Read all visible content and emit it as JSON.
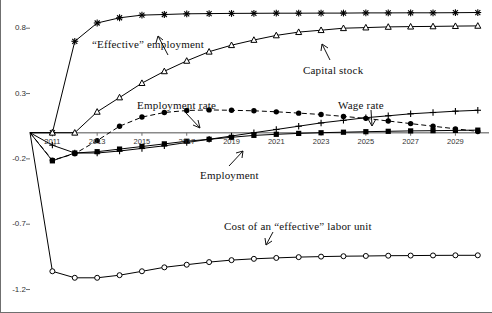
{
  "chart_data": {
    "type": "line",
    "title": "",
    "xlabel": "",
    "ylabel": "",
    "grid": false,
    "legend_position": "inline-annotations",
    "xlim": [
      2010,
      2030.5
    ],
    "ylim": [
      -1.28,
      0.97
    ],
    "yticks": [
      0.8,
      0.3,
      -0.2,
      -0.7,
      -1.2
    ],
    "ytick_labels": [
      "0.8",
      "0.3",
      "-0.2",
      "-0.7",
      "-1.2"
    ],
    "xticks": [
      2011,
      2013,
      2015,
      2017,
      2019,
      2021,
      2023,
      2025,
      2027,
      2029
    ],
    "xtick_labels": [
      "2011",
      "2013",
      "2015",
      "2017",
      "2019",
      "2021",
      "2023",
      "2025",
      "2027",
      "2029"
    ],
    "x": [
      2010,
      2011,
      2012,
      2013,
      2014,
      2015,
      2016,
      2017,
      2018,
      2019,
      2020,
      2021,
      2022,
      2023,
      2024,
      2025,
      2026,
      2027,
      2028,
      2029,
      2030
    ],
    "series": [
      {
        "name": "“Effective” employment",
        "marker": "star",
        "linestyle": "solid",
        "values": [
          0.0,
          0.0,
          0.7,
          0.84,
          0.88,
          0.9,
          0.905,
          0.91,
          0.912,
          0.913,
          0.914,
          0.915,
          0.915,
          0.916,
          0.916,
          0.917,
          0.917,
          0.918,
          0.918,
          0.919,
          0.92
        ]
      },
      {
        "name": "Capital stock",
        "marker": "triangle-open",
        "linestyle": "solid",
        "values": [
          0.0,
          0.0,
          0.0,
          0.16,
          0.27,
          0.38,
          0.47,
          0.55,
          0.62,
          0.67,
          0.71,
          0.745,
          0.77,
          0.785,
          0.8,
          0.805,
          0.81,
          0.812,
          0.814,
          0.816,
          0.818
        ]
      },
      {
        "name": "Employment rate",
        "marker": "circle-filled",
        "linestyle": "dashed",
        "values": [
          0.0,
          -0.21,
          -0.16,
          -0.06,
          0.05,
          0.12,
          0.155,
          0.17,
          0.175,
          0.172,
          0.168,
          0.16,
          0.15,
          0.14,
          0.125,
          0.11,
          0.09,
          0.07,
          0.05,
          0.03,
          0.01
        ]
      },
      {
        "name": "Employment",
        "marker": "square-filled",
        "linestyle": "solid",
        "values": [
          0.0,
          -0.215,
          -0.155,
          -0.145,
          -0.125,
          -0.105,
          -0.085,
          -0.065,
          -0.05,
          -0.035,
          -0.02,
          -0.012,
          -0.005,
          0.0,
          0.004,
          0.008,
          0.011,
          0.014,
          0.016,
          0.018,
          0.02
        ]
      },
      {
        "name": "Wage rate",
        "marker": "plus",
        "linestyle": "solid",
        "values": [
          0.0,
          -0.095,
          -0.155,
          -0.155,
          -0.14,
          -0.12,
          -0.1,
          -0.075,
          -0.05,
          -0.025,
          0.0,
          0.025,
          0.05,
          0.075,
          0.095,
          0.115,
          0.13,
          0.145,
          0.155,
          0.165,
          0.172
        ]
      },
      {
        "name": "Cost of an “effective” labor unit",
        "marker": "circle-open",
        "linestyle": "solid",
        "values": [
          0.0,
          -1.06,
          -1.11,
          -1.11,
          -1.09,
          -1.06,
          -1.03,
          -1.01,
          -0.99,
          -0.975,
          -0.965,
          -0.958,
          -0.952,
          -0.948,
          -0.945,
          -0.943,
          -0.941,
          -0.94,
          -0.939,
          -0.938,
          -0.938
        ]
      }
    ],
    "annotations": [
      {
        "id": "effective-employment",
        "text": "“Effective” employment"
      },
      {
        "id": "capital-stock",
        "text": "Capital stock"
      },
      {
        "id": "employment-rate",
        "text": "Employment rate"
      },
      {
        "id": "wage-rate",
        "text": "Wage rate"
      },
      {
        "id": "employment",
        "text": "Employment"
      },
      {
        "id": "cost-effective-labor-unit",
        "text": "Cost of an “effective” labor unit"
      }
    ],
    "colors": {
      "line": "#000000",
      "axis": "#6f6f6f",
      "zero_line": "#8a8a8a",
      "background": "#ffffff"
    }
  }
}
